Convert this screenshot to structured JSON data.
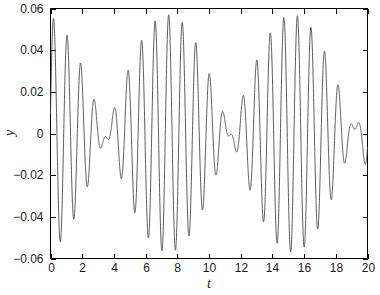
{
  "chart_data": {
    "type": "line",
    "title": "",
    "subtitle": "",
    "xlabel": "t",
    "ylabel": "y",
    "xlim": [
      0,
      20
    ],
    "ylim": [
      -0.06,
      0.06
    ],
    "grid": false,
    "legend": null,
    "xticks": [
      0,
      2,
      4,
      6,
      8,
      10,
      12,
      14,
      16,
      18,
      20
    ],
    "xticklabels": [
      "0",
      "2",
      "4",
      "6",
      "8",
      "10",
      "12",
      "14",
      "16",
      "18",
      "20"
    ],
    "yticks": [
      -0.06,
      -0.04,
      -0.02,
      0,
      0.02,
      0.04,
      0.06
    ],
    "yticklabels": [
      "-0.06",
      "-0.04",
      "-0.02",
      "0",
      "0.02",
      "0.04",
      "0.06"
    ],
    "line_color": "#4a4a4a",
    "line_width": 0.9,
    "series": [
      {
        "name": "y(t)",
        "description": "Amplitude-modulated beating oscillation, two close frequencies",
        "model": {
          "form": "A1*sin(w1*t) + A2*sin(w2*t + phi)",
          "A1": 0.0295,
          "w1": 6.95,
          "A2": 0.0275,
          "w2": 7.75,
          "phi": 0.35
        },
        "x": [
          0,
          0.5,
          1.05,
          1.55,
          2.05,
          2.6,
          3.1,
          3.65,
          4.15,
          4.7,
          5.2,
          5.7,
          6.25,
          6.75,
          7.25,
          7.85,
          8.35,
          8.85,
          9.35,
          9.9,
          10.4,
          10.9,
          11.4,
          11.95,
          12.45,
          13.0,
          13.5,
          14.0,
          14.5,
          15.05,
          15.55,
          16.1,
          16.6,
          17.15,
          17.65,
          18.2,
          18.7,
          19.25,
          19.75,
          20
        ],
        "y": [
          0.002,
          0.05,
          -0.026,
          0.012,
          -0.058,
          0.003,
          -0.038,
          0.041,
          -0.003,
          0.056,
          -0.015,
          0.023,
          -0.052,
          -0.001,
          -0.048,
          0.029,
          -0.01,
          0.057,
          -0.006,
          0.034,
          -0.044,
          0.0,
          -0.055,
          -0.02,
          0.017,
          0.053,
          -0.008,
          0.045,
          -0.033,
          -0.057,
          0.007,
          -0.027,
          0.001,
          0.046,
          -0.021,
          0.053,
          -0.019,
          0.016,
          -0.055,
          -0.03
        ],
        "peaks_positive": [
          {
            "t": 0.5,
            "y": 0.05
          },
          {
            "t": 1.55,
            "y": 0.012
          },
          {
            "t": 3.65,
            "y": 0.041
          },
          {
            "t": 4.7,
            "y": 0.056
          },
          {
            "t": 5.7,
            "y": 0.023
          },
          {
            "t": 7.85,
            "y": 0.029
          },
          {
            "t": 8.85,
            "y": 0.057
          },
          {
            "t": 9.9,
            "y": 0.034
          },
          {
            "t": 11.95,
            "y": 0.017
          },
          {
            "t": 13.0,
            "y": 0.053
          },
          {
            "t": 14.0,
            "y": 0.045
          },
          {
            "t": 16.1,
            "y": 0.007
          },
          {
            "t": 17.15,
            "y": 0.046
          },
          {
            "t": 18.2,
            "y": 0.053
          },
          {
            "t": 19.25,
            "y": 0.016
          }
        ],
        "peaks_negative": [
          {
            "t": 1.05,
            "y": -0.026
          },
          {
            "t": 2.05,
            "y": -0.058
          },
          {
            "t": 3.1,
            "y": -0.038
          },
          {
            "t": 6.25,
            "y": -0.052
          },
          {
            "t": 7.25,
            "y": -0.048
          },
          {
            "t": 10.4,
            "y": -0.044
          },
          {
            "t": 11.4,
            "y": -0.055
          },
          {
            "t": 15.05,
            "y": -0.057
          },
          {
            "t": 15.55,
            "y": -0.033
          },
          {
            "t": 19.75,
            "y": -0.055
          }
        ]
      }
    ]
  },
  "axes": {
    "x_label": "t",
    "y_label": "y"
  }
}
